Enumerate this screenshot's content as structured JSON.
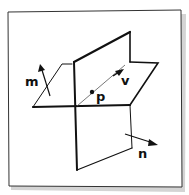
{
  "diagram": {
    "labels": {
      "normal_1": "m",
      "normal_2": "n",
      "direction": "v",
      "point": "p"
    },
    "colors": {
      "ink": "#111111",
      "paper": "#ffffff",
      "shadow": "#c8c8c8"
    }
  }
}
